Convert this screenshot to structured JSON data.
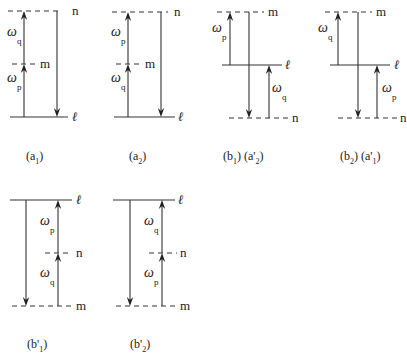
{
  "colors": {
    "line": "#333333",
    "text": "#222222",
    "background": "#ffffff"
  },
  "panels": [
    {
      "id": "a1",
      "caption": {
        "parts": [
          {
            "t": "(a",
            "sub": false
          },
          {
            "t": "1",
            "sub": true
          },
          {
            "t": ")",
            "sub": false
          }
        ],
        "x": 26,
        "y": 160
      },
      "levels": [
        {
          "name": "n",
          "y": 11,
          "x1": 8,
          "x2": 62,
          "style": "dash",
          "label_x": 72
        },
        {
          "name": "m",
          "y": 64,
          "x1": 12,
          "x2": 36,
          "style": "dash",
          "label_x": 40
        },
        {
          "name": "ℓ",
          "y": 117,
          "x1": 10,
          "x2": 68,
          "style": "solid",
          "label_x": 72,
          "italic": true
        }
      ],
      "arrows": [
        {
          "x": 24,
          "y_from": 117,
          "y_to": 64,
          "dir": "up"
        },
        {
          "x": 24,
          "y_from": 64,
          "y_to": 11,
          "dir": "up"
        },
        {
          "x": 57,
          "y_from": 11,
          "y_to": 117,
          "dir": "down"
        }
      ],
      "omegas": [
        {
          "sub": "q",
          "x": 7,
          "y": 36
        },
        {
          "sub": "p",
          "x": 7,
          "y": 82
        }
      ]
    },
    {
      "id": "a2",
      "caption": {
        "parts": [
          {
            "t": "(a",
            "sub": false
          },
          {
            "t": "2",
            "sub": true
          },
          {
            "t": ")",
            "sub": false
          }
        ],
        "x": 129,
        "y": 160
      },
      "levels": [
        {
          "name": "n",
          "y": 12,
          "x1": 112,
          "x2": 168,
          "style": "dash",
          "label_x": 174
        },
        {
          "name": "m",
          "y": 64,
          "x1": 116,
          "x2": 140,
          "style": "dash",
          "label_x": 145
        },
        {
          "name": "ℓ",
          "y": 117,
          "x1": 114,
          "x2": 175,
          "style": "solid",
          "label_x": 178,
          "italic": true
        }
      ],
      "arrows": [
        {
          "x": 128,
          "y_from": 117,
          "y_to": 64,
          "dir": "up"
        },
        {
          "x": 128,
          "y_from": 64,
          "y_to": 12,
          "dir": "up"
        },
        {
          "x": 161,
          "y_from": 12,
          "y_to": 117,
          "dir": "down"
        }
      ],
      "omegas": [
        {
          "sub": "p",
          "x": 111,
          "y": 36
        },
        {
          "sub": "q",
          "x": 111,
          "y": 82
        }
      ]
    },
    {
      "id": "b1",
      "caption": {
        "parts": [
          {
            "t": "(b",
            "sub": false
          },
          {
            "t": "1",
            "sub": true
          },
          {
            "t": ") (a'",
            "sub": false
          },
          {
            "t": "2",
            "sub": true
          },
          {
            "t": ")",
            "sub": false
          }
        ],
        "x": 223,
        "y": 160
      },
      "levels": [
        {
          "name": "m",
          "y": 12,
          "x1": 217,
          "x2": 264,
          "style": "dash",
          "label_x": 268
        },
        {
          "name": "ℓ",
          "y": 65,
          "x1": 222,
          "x2": 282,
          "style": "solid",
          "label_x": 285,
          "italic": true
        },
        {
          "name": "n",
          "y": 118,
          "x1": 229,
          "x2": 290,
          "style": "dash",
          "label_x": 292
        }
      ],
      "arrows": [
        {
          "x": 230,
          "y_from": 65,
          "y_to": 12,
          "dir": "up"
        },
        {
          "x": 249,
          "y_from": 12,
          "y_to": 118,
          "dir": "down"
        },
        {
          "x": 269,
          "y_from": 118,
          "y_to": 65,
          "dir": "up"
        }
      ],
      "omegas": [
        {
          "sub": "p",
          "x": 212,
          "y": 32
        },
        {
          "sub": "q",
          "x": 272,
          "y": 92
        }
      ]
    },
    {
      "id": "b2",
      "caption": {
        "parts": [
          {
            "t": "(b",
            "sub": false
          },
          {
            "t": "2",
            "sub": true
          },
          {
            "t": ") (a'",
            "sub": false
          },
          {
            "t": "1",
            "sub": true
          },
          {
            "t": ")",
            "sub": false
          }
        ],
        "x": 340,
        "y": 160
      },
      "levels": [
        {
          "name": "m",
          "y": 12,
          "x1": 325,
          "x2": 372,
          "style": "dash",
          "label_x": 376
        },
        {
          "name": "ℓ",
          "y": 65,
          "x1": 330,
          "x2": 390,
          "style": "solid",
          "label_x": 394,
          "italic": true
        },
        {
          "name": "n",
          "y": 118,
          "x1": 338,
          "x2": 398,
          "style": "dash",
          "label_x": 400
        }
      ],
      "arrows": [
        {
          "x": 338,
          "y_from": 65,
          "y_to": 12,
          "dir": "up"
        },
        {
          "x": 358,
          "y_from": 12,
          "y_to": 118,
          "dir": "down"
        },
        {
          "x": 377,
          "y_from": 118,
          "y_to": 65,
          "dir": "up"
        }
      ],
      "omegas": [
        {
          "sub": "q",
          "x": 318,
          "y": 32
        },
        {
          "sub": "p",
          "x": 382,
          "y": 92
        }
      ]
    },
    {
      "id": "b1prime",
      "caption": {
        "parts": [
          {
            "t": "(b'",
            "sub": false
          },
          {
            "t": "1",
            "sub": true
          },
          {
            "t": ")",
            "sub": false
          }
        ],
        "x": 27,
        "y": 348
      },
      "levels": [
        {
          "name": "ℓ",
          "y": 200,
          "x1": 10,
          "x2": 72,
          "style": "solid",
          "label_x": 76,
          "italic": true
        },
        {
          "name": "n",
          "y": 253,
          "x1": 45,
          "x2": 72,
          "style": "dash",
          "label_x": 76
        },
        {
          "name": "m",
          "y": 306,
          "x1": 12,
          "x2": 72,
          "style": "dash",
          "label_x": 76
        }
      ],
      "arrows": [
        {
          "x": 26,
          "y_from": 200,
          "y_to": 306,
          "dir": "down"
        },
        {
          "x": 58,
          "y_from": 306,
          "y_to": 253,
          "dir": "up"
        },
        {
          "x": 58,
          "y_from": 253,
          "y_to": 200,
          "dir": "up"
        }
      ],
      "omegas": [
        {
          "sub": "p",
          "x": 40,
          "y": 225
        },
        {
          "sub": "q",
          "x": 40,
          "y": 277
        }
      ]
    },
    {
      "id": "b2prime",
      "caption": {
        "parts": [
          {
            "t": "(b'",
            "sub": false
          },
          {
            "t": "2",
            "sub": true
          },
          {
            "t": ")",
            "sub": false
          }
        ],
        "x": 130,
        "y": 348
      },
      "levels": [
        {
          "name": "ℓ",
          "y": 200,
          "x1": 113,
          "x2": 175,
          "style": "solid",
          "label_x": 178,
          "italic": true
        },
        {
          "name": "n",
          "y": 253,
          "x1": 149,
          "x2": 177,
          "style": "dash",
          "label_x": 180
        },
        {
          "name": "m",
          "y": 306,
          "x1": 116,
          "x2": 176,
          "style": "dash",
          "label_x": 180
        }
      ],
      "arrows": [
        {
          "x": 130,
          "y_from": 200,
          "y_to": 306,
          "dir": "down"
        },
        {
          "x": 162,
          "y_from": 306,
          "y_to": 253,
          "dir": "up"
        },
        {
          "x": 162,
          "y_from": 253,
          "y_to": 200,
          "dir": "up"
        }
      ],
      "omegas": [
        {
          "sub": "q",
          "x": 144,
          "y": 225
        },
        {
          "sub": "p",
          "x": 144,
          "y": 277
        }
      ]
    }
  ],
  "symbols": {
    "omega": "ω"
  }
}
